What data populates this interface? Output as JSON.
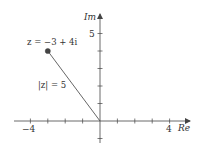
{
  "diagram": {
    "axes": {
      "x_label": "Re",
      "y_label": "Im",
      "x_tick_labels": {
        "neg": "−4",
        "pos": "4"
      },
      "y_tick_labels": {
        "top": "5"
      },
      "x_range": [
        -4,
        4
      ],
      "y_range": [
        -1,
        5
      ]
    },
    "point": {
      "label": "z = −3 + 4i",
      "re": -3,
      "im": 4
    },
    "segment": {
      "label": "|z| = 5",
      "from": [
        0,
        0
      ],
      "to": [
        -3,
        4
      ]
    },
    "colors": {
      "axis": "#444444",
      "line": "#555555",
      "point": "#444444",
      "text": "#333333"
    }
  }
}
